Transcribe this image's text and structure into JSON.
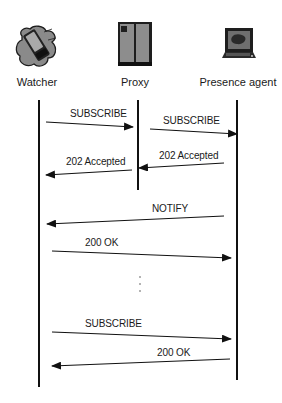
{
  "diagram": {
    "type": "sequence",
    "actors": [
      {
        "id": "watcher",
        "label": "Watcher",
        "icon": "handheld-device-icon"
      },
      {
        "id": "proxy",
        "label": "Proxy",
        "icon": "server-tower-icon"
      },
      {
        "id": "presence_agent",
        "label": "Presence agent",
        "icon": "computer-terminal-icon"
      }
    ],
    "messages": [
      {
        "from": "watcher",
        "to": "proxy",
        "label": "SUBSCRIBE"
      },
      {
        "from": "proxy",
        "to": "presence_agent",
        "label": "SUBSCRIBE"
      },
      {
        "from": "presence_agent",
        "to": "proxy",
        "label": "202 Accepted"
      },
      {
        "from": "proxy",
        "to": "watcher",
        "label": "202 Accepted"
      },
      {
        "from": "presence_agent",
        "to": "watcher",
        "label": "NOTIFY"
      },
      {
        "from": "watcher",
        "to": "presence_agent",
        "label": "200 OK"
      },
      {
        "from": "watcher",
        "to": "presence_agent",
        "label": "SUBSCRIBE"
      },
      {
        "from": "presence_agent",
        "to": "watcher",
        "label": "200 OK"
      }
    ],
    "ellipsis": "⋮",
    "colors": {
      "line": "#111111",
      "text": "#1a1a1a",
      "icon_gray": "#8a8a8a",
      "icon_dark": "#1e1e1e",
      "background": "#ffffff"
    }
  }
}
